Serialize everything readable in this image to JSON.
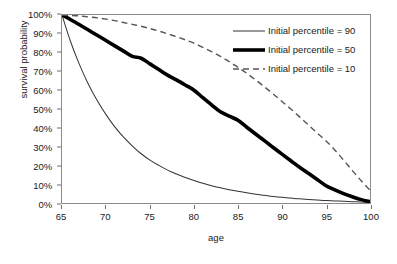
{
  "chart_data": {
    "type": "line",
    "title": "",
    "xlabel": "age",
    "ylabel": "survival probability",
    "xlim": [
      65,
      100
    ],
    "ylim": [
      0,
      1
    ],
    "grid": false,
    "legend_position": "top-right",
    "x_ticks": [
      65,
      70,
      75,
      80,
      85,
      90,
      95,
      100
    ],
    "x_tick_labels": [
      "65",
      "70",
      "75",
      "80",
      "85",
      "90",
      "95",
      "100"
    ],
    "y_ticks": [
      0,
      0.1,
      0.2,
      0.3,
      0.4,
      0.5,
      0.6,
      0.7,
      0.8,
      0.9,
      1.0
    ],
    "y_tick_labels": [
      "0%",
      "10%",
      "20%",
      "30%",
      "40%",
      "50%",
      "60%",
      "70%",
      "80%",
      "90%",
      "100%"
    ],
    "x": [
      65,
      66,
      67,
      68,
      69,
      70,
      71,
      72,
      73,
      74,
      75,
      76,
      77,
      78,
      79,
      80,
      81,
      82,
      83,
      84,
      85,
      86,
      87,
      88,
      89,
      90,
      91,
      92,
      93,
      94,
      95,
      96,
      97,
      98,
      99,
      100
    ],
    "series": [
      {
        "name": "Initial percentile = 90",
        "style": "solid-thin",
        "color": "#333333",
        "width": 1,
        "values": [
          1.0,
          0.855,
          0.735,
          0.632,
          0.545,
          0.47,
          0.405,
          0.35,
          0.303,
          0.262,
          0.228,
          0.2,
          0.175,
          0.154,
          0.136,
          0.12,
          0.105,
          0.092,
          0.081,
          0.071,
          0.062,
          0.054,
          0.047,
          0.041,
          0.035,
          0.03,
          0.026,
          0.022,
          0.019,
          0.016,
          0.013,
          0.011,
          0.009,
          0.007,
          0.005,
          0.003
        ]
      },
      {
        "name": "Initial percentile = 50",
        "style": "solid-thick",
        "color": "#000000",
        "width": 3.6,
        "values": [
          1.0,
          0.975,
          0.948,
          0.92,
          0.892,
          0.864,
          0.836,
          0.808,
          0.78,
          0.77,
          0.74,
          0.71,
          0.68,
          0.655,
          0.628,
          0.6,
          0.56,
          0.522,
          0.485,
          0.462,
          0.44,
          0.403,
          0.367,
          0.332,
          0.295,
          0.26,
          0.225,
          0.19,
          0.158,
          0.125,
          0.092,
          0.07,
          0.05,
          0.033,
          0.018,
          0.008
        ]
      },
      {
        "name": "Initial percentile = 10",
        "style": "dashed",
        "color": "#555555",
        "width": 1.4,
        "values": [
          1.0,
          0.998,
          0.995,
          0.99,
          0.985,
          0.978,
          0.97,
          0.96,
          0.95,
          0.94,
          0.928,
          0.915,
          0.9,
          0.885,
          0.868,
          0.85,
          0.828,
          0.805,
          0.78,
          0.752,
          0.722,
          0.69,
          0.655,
          0.618,
          0.58,
          0.54,
          0.5,
          0.458,
          0.415,
          0.372,
          0.33,
          0.282,
          0.228,
          0.172,
          0.118,
          0.068
        ]
      }
    ]
  }
}
